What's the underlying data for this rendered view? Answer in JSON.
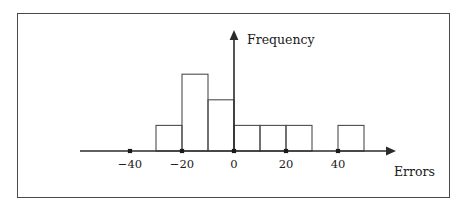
{
  "chart_data": {
    "type": "bar",
    "title": "",
    "subtitle": "",
    "xlabel": "Errors",
    "ylabel": "Frequency",
    "bin_width": 10,
    "bin_edges": [
      -30,
      -20,
      -10,
      0,
      10,
      20,
      30,
      40,
      50
    ],
    "categories": [
      "[-30,-20)",
      "[-20,-10)",
      "[-10,0)",
      "[0,10)",
      "[10,20)",
      "[20,30)",
      "[30,40)",
      "[40,50)"
    ],
    "bin_starts": [
      -30,
      -20,
      -10,
      0,
      10,
      20,
      30,
      40
    ],
    "bin_ends": [
      -20,
      -10,
      0,
      10,
      20,
      30,
      40,
      50
    ],
    "values": [
      1,
      3,
      2,
      1,
      1,
      1,
      0,
      1
    ],
    "xlim": [
      -48,
      61
    ],
    "ylim": [
      0,
      3.6
    ],
    "xticks": [
      -40,
      -20,
      0,
      20,
      40
    ],
    "xtick_labels": [
      "−40",
      "−20",
      "0",
      "20",
      "40"
    ],
    "yticks": [],
    "ytick_labels": [],
    "grid": false,
    "legend": null,
    "legend_position": "none",
    "bar_style": "outline",
    "annotations": []
  },
  "figure": {
    "frame_visible": true,
    "frame_color": "#4a4a4a",
    "background_color": "#ffffff"
  },
  "axes": {
    "x_axis_arrow": true,
    "y_axis_arrow": true,
    "axis_color": "#2b2b2b",
    "tick_marker_style": "dot",
    "x_axis_label": "Errors",
    "y_axis_label": "Frequency"
  },
  "colors": {
    "bar_stroke": "#4d4d4d",
    "bar_fill": "none",
    "axis": "#2b2b2b",
    "text": "#1a1a1a",
    "frame": "#4a4a4a"
  }
}
